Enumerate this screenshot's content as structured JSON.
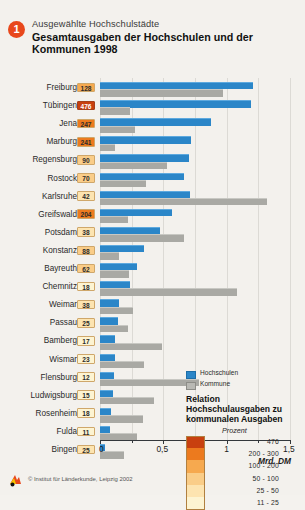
{
  "header": {
    "badge": "1",
    "subtitle": "Ausgewählte Hochschulstädte",
    "title": "Gesamtausgaben der Hochschulen und der Kommunen 1998"
  },
  "legend": {
    "series": [
      {
        "label": "Hochschulen",
        "swatch": "blue"
      },
      {
        "label": "Kommune",
        "swatch": "grey"
      }
    ],
    "scale_title": "Relation Hochschulausgaben zu kommunalen Ausgaben",
    "scale_unit": "Prozent",
    "scale_classes": [
      {
        "label": "476",
        "color": "#c8400f"
      },
      {
        "label": "200 - 300",
        "color": "#ec7a1e"
      },
      {
        "label": "100 - 200",
        "color": "#f6a94f"
      },
      {
        "label": "50 - 100",
        "color": "#facd88"
      },
      {
        "label": "25 -  50",
        "color": "#fde4b0"
      },
      {
        "label": "11 -  25",
        "color": "#fdf4d2"
      }
    ]
  },
  "axis": {
    "ticks": [
      "0",
      "0,5",
      "1",
      "1,5"
    ],
    "unit": "Mrd. DM",
    "min": 0,
    "max": 1.5
  },
  "footer": {
    "source": "© Institut für Länderkunde, Leipzig 2002"
  },
  "chart_data": {
    "type": "bar",
    "orientation": "horizontal",
    "title": "Gesamtausgaben der Hochschulen und der Kommunen 1998",
    "xlabel": "Mrd. DM",
    "ylabel": "",
    "xlim": [
      0,
      1.5
    ],
    "grid": true,
    "legend_position": "center-right",
    "categories": [
      "Freiburg",
      "Tübingen",
      "Jena",
      "Marburg",
      "Regensburg",
      "Rostock",
      "Karlsruhe",
      "Greifswald",
      "Potsdam",
      "Konstanz",
      "Bayreuth",
      "Chemnitz",
      "Weimar",
      "Passau",
      "Bamberg",
      "Wismar",
      "Flensburg",
      "Ludwigsburg",
      "Rosenheim",
      "Fulda",
      "Bingen"
    ],
    "series": [
      {
        "name": "Hochschulen",
        "color": "#2b86c8",
        "values": [
          1.21,
          1.19,
          0.88,
          0.72,
          0.7,
          0.66,
          0.71,
          0.57,
          0.47,
          0.35,
          0.29,
          0.24,
          0.15,
          0.14,
          0.12,
          0.12,
          0.11,
          0.1,
          0.09,
          0.08,
          0.04
        ]
      },
      {
        "name": "Kommune",
        "color": "#a9a9a4",
        "values": [
          0.97,
          0.24,
          0.28,
          0.12,
          0.53,
          0.36,
          1.32,
          0.22,
          0.66,
          0.15,
          0.23,
          1.08,
          0.26,
          0.22,
          0.49,
          0.35,
          0.78,
          0.43,
          0.34,
          0.29,
          0.19
        ]
      }
    ],
    "ratio_percent": {
      "unit": "Prozent",
      "values": [
        128,
        476,
        247,
        241,
        90,
        70,
        42,
        204,
        38,
        88,
        62,
        18,
        38,
        25,
        17,
        23,
        12,
        15,
        18,
        11,
        25
      ]
    }
  },
  "rows": [
    {
      "city": "Freiburg",
      "value": "128",
      "color": "#f6a94f",
      "dark": false,
      "hs": 1.21,
      "km": 0.97
    },
    {
      "city": "Tübingen",
      "value": "476",
      "color": "#c8400f",
      "dark": true,
      "hs": 1.19,
      "km": 0.24
    },
    {
      "city": "Jena",
      "value": "247",
      "color": "#ec7a1e",
      "dark": false,
      "hs": 0.88,
      "km": 0.28
    },
    {
      "city": "Marburg",
      "value": "241",
      "color": "#ec7a1e",
      "dark": false,
      "hs": 0.72,
      "km": 0.12
    },
    {
      "city": "Regensburg",
      "value": "90",
      "color": "#facd88",
      "dark": false,
      "hs": 0.7,
      "km": 0.53
    },
    {
      "city": "Rostock",
      "value": "70",
      "color": "#facd88",
      "dark": false,
      "hs": 0.66,
      "km": 0.36
    },
    {
      "city": "Karlsruhe",
      "value": "42",
      "color": "#fde4b0",
      "dark": false,
      "hs": 0.71,
      "km": 1.32
    },
    {
      "city": "Greifswald",
      "value": "204",
      "color": "#ec7a1e",
      "dark": false,
      "hs": 0.57,
      "km": 0.22
    },
    {
      "city": "Potsdam",
      "value": "38",
      "color": "#fde4b0",
      "dark": false,
      "hs": 0.47,
      "km": 0.66
    },
    {
      "city": "Konstanz",
      "value": "88",
      "color": "#facd88",
      "dark": false,
      "hs": 0.35,
      "km": 0.15
    },
    {
      "city": "Bayreuth",
      "value": "62",
      "color": "#facd88",
      "dark": false,
      "hs": 0.29,
      "km": 0.23
    },
    {
      "city": "Chemnitz",
      "value": "18",
      "color": "#fdf4d2",
      "dark": false,
      "hs": 0.24,
      "km": 1.08
    },
    {
      "city": "Weimar",
      "value": "38",
      "color": "#fde4b0",
      "dark": false,
      "hs": 0.15,
      "km": 0.26
    },
    {
      "city": "Passau",
      "value": "25",
      "color": "#fde4b0",
      "dark": false,
      "hs": 0.14,
      "km": 0.22
    },
    {
      "city": "Bamberg",
      "value": "17",
      "color": "#fdf4d2",
      "dark": false,
      "hs": 0.12,
      "km": 0.49
    },
    {
      "city": "Wismar",
      "value": "23",
      "color": "#fdf4d2",
      "dark": false,
      "hs": 0.12,
      "km": 0.35
    },
    {
      "city": "Flensburg",
      "value": "12",
      "color": "#fdf4d2",
      "dark": false,
      "hs": 0.11,
      "km": 0.78
    },
    {
      "city": "Ludwigsburg",
      "value": "15",
      "color": "#fdf4d2",
      "dark": false,
      "hs": 0.1,
      "km": 0.43
    },
    {
      "city": "Rosenheim",
      "value": "18",
      "color": "#fdf4d2",
      "dark": false,
      "hs": 0.09,
      "km": 0.34
    },
    {
      "city": "Fulda",
      "value": "11",
      "color": "#fdf4d2",
      "dark": false,
      "hs": 0.08,
      "km": 0.29
    },
    {
      "city": "Bingen",
      "value": "25",
      "color": "#fde4b0",
      "dark": false,
      "hs": 0.04,
      "km": 0.19
    }
  ]
}
